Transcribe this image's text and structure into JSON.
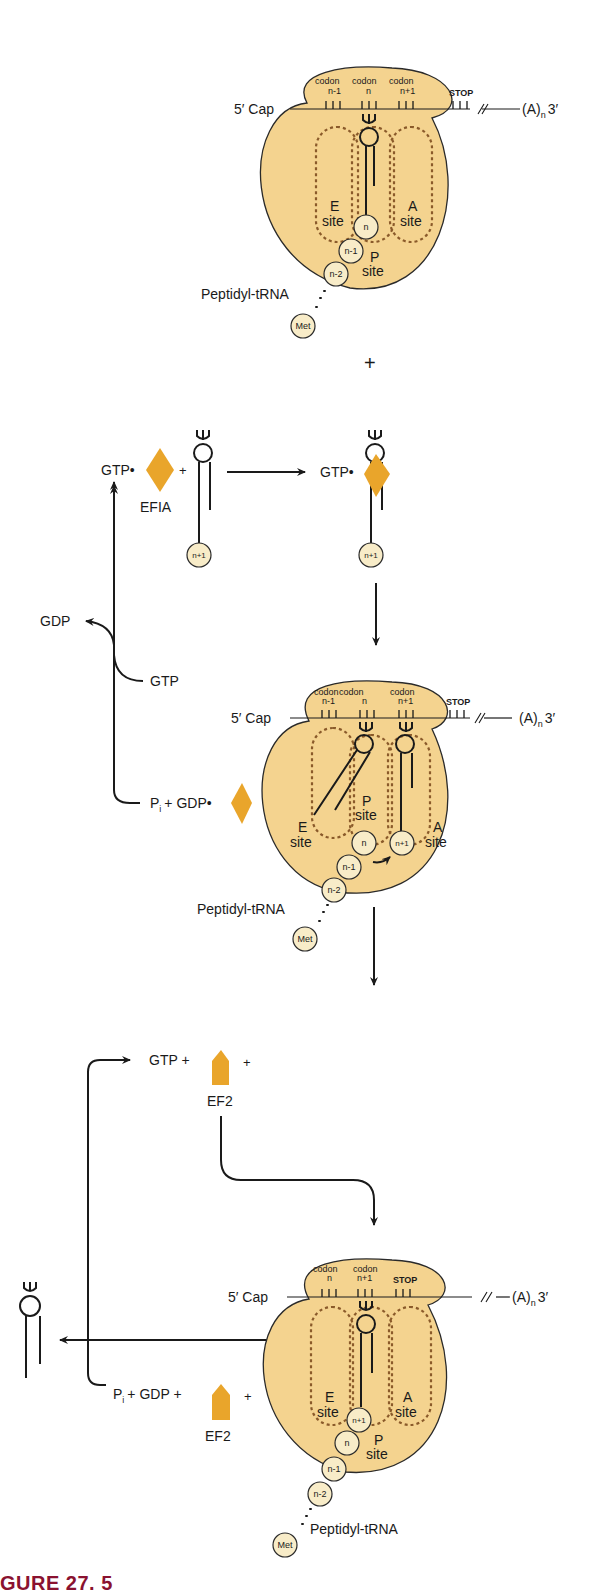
{
  "colors": {
    "ribosome_fill": "#f4d38f",
    "ribosome_stroke": "#2a2a2a",
    "site_dash": "#8a5a2a",
    "residue_fill": "#f8ecc8",
    "factor_fill": "#e9a52b",
    "caption": "#8a1230"
  },
  "mrna": {
    "five_prime": "5′ Cap",
    "three_prime_a": "(A)",
    "three_prime_n": "n",
    "three_prime_end": "3′",
    "stop": "STOP"
  },
  "sites": {
    "e_top": "E",
    "e_bottom": "site",
    "p_top": "P",
    "p_bottom": "site",
    "a_top": "A",
    "a_bottom": "site"
  },
  "stage1": {
    "codons": [
      {
        "word": "codon",
        "index": "n-1"
      },
      {
        "word": "codon",
        "index": "n"
      },
      {
        "word": "codon",
        "index": "n+1"
      }
    ],
    "residues": [
      "n",
      "n-1",
      "n-2"
    ],
    "met": "Met",
    "peptidyl": "Peptidyl-tRNA"
  },
  "plus_sign": "+",
  "step_ef1a": {
    "gtp_dot": "GTP•",
    "plus": "+",
    "factor_label": "EFIA",
    "aa_residue": "n+1",
    "product_gtp_dot": "GTP•",
    "product_residue": "n+1",
    "gdp_out": "GDP",
    "gtp_in": "GTP",
    "pi": "P",
    "pi_sub": "i",
    "pi_gdp": "+ GDP•"
  },
  "stage2": {
    "codons": [
      {
        "word": "codon",
        "index": "n-1"
      },
      {
        "word": "codon",
        "index": "n"
      },
      {
        "word": "codon",
        "index": "n+1"
      }
    ],
    "residues": [
      "n+1",
      "n",
      "n-1",
      "n-2"
    ],
    "met": "Met",
    "peptidyl": "Peptidyl-tRNA"
  },
  "step_ef2": {
    "gtp_plus": "GTP +",
    "plus": "+",
    "factor_label": "EF2",
    "pi": "P",
    "pi_sub": "i",
    "pi_gdp_plus": "+ GDP +",
    "factor_label_out": "EF2",
    "plus_out": "+"
  },
  "stage3": {
    "codons": [
      {
        "word": "codon",
        "index": "n"
      },
      {
        "word": "codon",
        "index": "n+1"
      }
    ],
    "residues": [
      "n+1",
      "n",
      "n-1",
      "n-2"
    ],
    "met": "Met",
    "peptidyl": "Peptidyl-tRNA"
  },
  "caption": {
    "text": "GURE 27. 5"
  }
}
